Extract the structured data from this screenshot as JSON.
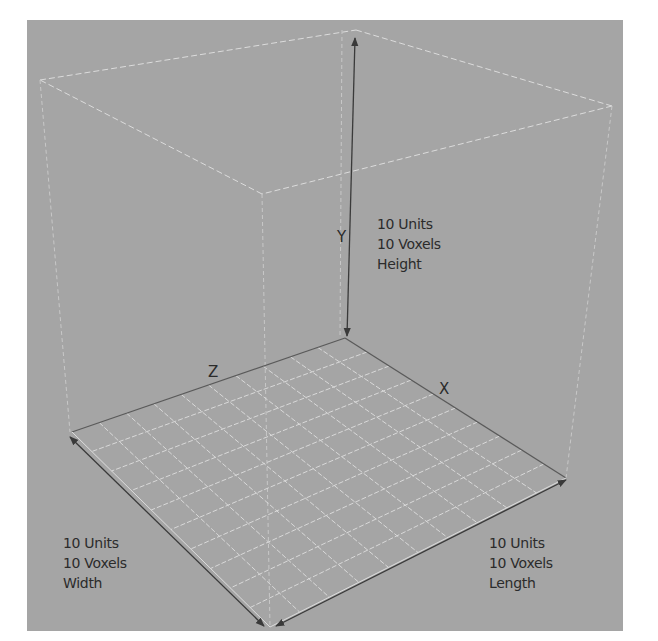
{
  "diagram": {
    "title": "",
    "colors": {
      "background": "#a5a5a5",
      "page": "#ffffff",
      "axis_line": "#3a3a3a",
      "grid_line": "#d9d9d9",
      "text": "#2b2b2b"
    },
    "axes": {
      "x": {
        "letter": "X"
      },
      "y": {
        "letter": "Y"
      },
      "z": {
        "letter": "Z"
      }
    },
    "labels": {
      "height": {
        "units": "10 Units",
        "voxels": "10 Voxels",
        "dimension": "Height"
      },
      "width": {
        "units": "10 Units",
        "voxels": "10 Voxels",
        "dimension": "Width"
      },
      "length": {
        "units": "10 Units",
        "voxels": "10 Voxels",
        "dimension": "Length"
      }
    },
    "grid": {
      "divisions": 10
    }
  }
}
